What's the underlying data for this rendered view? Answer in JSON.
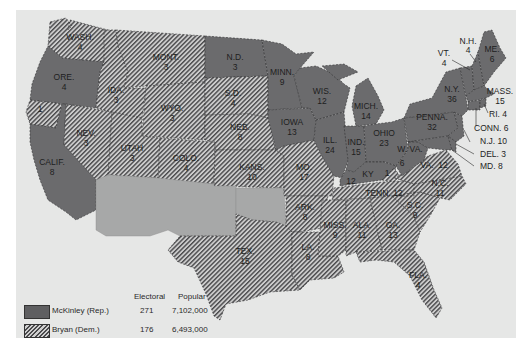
{
  "colors": {
    "background": "#ffffff",
    "map_frame": "#e6e7e6",
    "mckinley_fill": "#6b6b6d",
    "bryan_hatch_dark": "#4a4a4c",
    "bryan_hatch_light": "#cfcfcf",
    "territory_fill": "#a7a8a8",
    "label_text": "#1e1e1e"
  },
  "legend": {
    "headers": {
      "electoral": "Electoral",
      "popular": "Popular"
    },
    "entries": [
      {
        "name": "McKinley (Rep.)",
        "electoral": "271",
        "popular": "7,102,000",
        "pattern": "solid"
      },
      {
        "name": "Bryan (Dem.)",
        "electoral": "176",
        "popular": "6,493,000",
        "pattern": "hatched"
      }
    ]
  },
  "states": {
    "wash": {
      "abbr": "WASH.",
      "votes": "4",
      "party": "Bryan"
    },
    "ore": {
      "abbr": "ORE.",
      "votes": "4",
      "party": "McKinley"
    },
    "calif_dem": {
      "abbr": "",
      "votes": "1",
      "party": "Bryan"
    },
    "calif": {
      "abbr": "CALIF.",
      "votes": "8",
      "party": "McKinley"
    },
    "ida": {
      "abbr": "IDA.",
      "votes": "3",
      "party": "Bryan"
    },
    "nev": {
      "abbr": "NEV.",
      "votes": "3",
      "party": "Bryan"
    },
    "mont": {
      "abbr": "MONT.",
      "votes": "3",
      "party": "Bryan"
    },
    "wyo": {
      "abbr": "WYO.",
      "votes": "3",
      "party": "Bryan"
    },
    "utah": {
      "abbr": "UTAH",
      "votes": "3",
      "party": "Bryan"
    },
    "colo": {
      "abbr": "COLO.",
      "votes": "4",
      "party": "Bryan"
    },
    "nd": {
      "abbr": "N.D.",
      "votes": "3",
      "party": "McKinley"
    },
    "sd": {
      "abbr": "S.D.",
      "votes": "4",
      "party": "Bryan"
    },
    "neb": {
      "abbr": "NEB.",
      "votes": "8",
      "party": "Bryan"
    },
    "kans": {
      "abbr": "KANS.",
      "votes": "10",
      "party": "Bryan"
    },
    "tex": {
      "abbr": "TEX.",
      "votes": "15",
      "party": "Bryan"
    },
    "minn": {
      "abbr": "MINN.",
      "votes": "9",
      "party": "McKinley"
    },
    "iowa": {
      "abbr": "IOWA",
      "votes": "13",
      "party": "McKinley"
    },
    "mo": {
      "abbr": "MO.",
      "votes": "17",
      "party": "Bryan"
    },
    "ark": {
      "abbr": "ARK.",
      "votes": "8",
      "party": "Bryan"
    },
    "la": {
      "abbr": "LA.",
      "votes": "8",
      "party": "Bryan"
    },
    "wis": {
      "abbr": "WIS.",
      "votes": "12",
      "party": "McKinley"
    },
    "ill": {
      "abbr": "ILL.",
      "votes": "24",
      "party": "McKinley"
    },
    "mich": {
      "abbr": "MICH.",
      "votes": "14",
      "party": "McKinley"
    },
    "ind": {
      "abbr": "IND.",
      "votes": "15",
      "party": "McKinley"
    },
    "ohio": {
      "abbr": "OHIO",
      "votes": "23",
      "party": "McKinley"
    },
    "ky": {
      "abbr": "KY",
      "votes": "12",
      "party": "McKinley"
    },
    "ky_dem": {
      "abbr": "",
      "votes": "1",
      "party": "Bryan"
    },
    "tenn": {
      "abbr": "TENN.",
      "votes": "12",
      "party": "Bryan"
    },
    "miss": {
      "abbr": "MISS.",
      "votes": "9",
      "party": "Bryan"
    },
    "ala": {
      "abbr": "ALA.",
      "votes": "11",
      "party": "Bryan"
    },
    "ga": {
      "abbr": "GA.",
      "votes": "13",
      "party": "Bryan"
    },
    "fla": {
      "abbr": "FLA.",
      "votes": "4",
      "party": "Bryan"
    },
    "sc": {
      "abbr": "S.C.",
      "votes": "9",
      "party": "Bryan"
    },
    "nc": {
      "abbr": "N.C.",
      "votes": "11",
      "party": "Bryan"
    },
    "va": {
      "abbr": "VA.",
      "votes": "12",
      "party": "Bryan"
    },
    "wva": {
      "abbr": "W. VA.",
      "votes": "6",
      "party": "McKinley"
    },
    "penna": {
      "abbr": "PENNA.",
      "votes": "32",
      "party": "McKinley"
    },
    "ny": {
      "abbr": "N.Y.",
      "votes": "36",
      "party": "McKinley"
    },
    "vt": {
      "abbr": "VT.",
      "votes": "4",
      "party": "McKinley"
    },
    "nh": {
      "abbr": "N.H.",
      "votes": "4",
      "party": "McKinley"
    },
    "me": {
      "abbr": "ME.",
      "votes": "6",
      "party": "McKinley"
    },
    "mass": {
      "abbr": "MASS.",
      "votes": "15",
      "party": "McKinley"
    },
    "ri": {
      "abbr": "RI.",
      "votes": "4",
      "party": "McKinley"
    },
    "conn": {
      "abbr": "CONN.",
      "votes": "6",
      "party": "McKinley"
    },
    "nj": {
      "abbr": "N.J.",
      "votes": "10",
      "party": "McKinley"
    },
    "del": {
      "abbr": "DEL.",
      "votes": "3",
      "party": "McKinley"
    },
    "md": {
      "abbr": "MD.",
      "votes": "8",
      "party": "McKinley"
    }
  },
  "callouts": {
    "ri": "RI. 4",
    "conn": "CONN. 6",
    "nj": "N.J. 10",
    "del": "DEL. 3",
    "md": "MD. 8"
  },
  "territories": [
    "Arizona/New Mexico territory",
    "Oklahoma/Indian territory"
  ]
}
